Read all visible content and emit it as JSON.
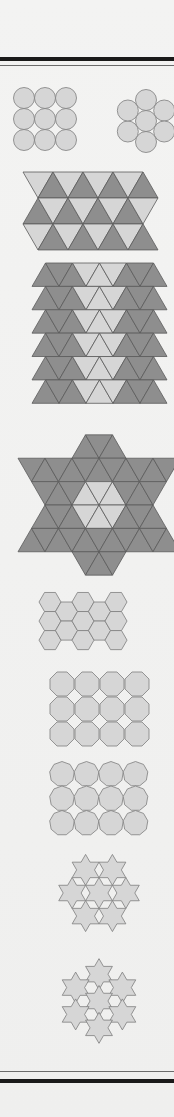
{
  "page": {
    "background": "#f1f1f0",
    "rules": [
      {
        "kind": "thick",
        "y": 57,
        "h": 4
      },
      {
        "kind": "thin",
        "y": 65,
        "h": 1
      },
      {
        "kind": "thin",
        "y": 1071,
        "h": 1
      },
      {
        "kind": "thick",
        "y": 1079,
        "h": 4
      }
    ]
  },
  "colors": {
    "light_fill": "#d6d6d6",
    "dark_fill": "#8e8e8e",
    "stroke": "#7d7d7d",
    "dark_stroke": "#5a5a5a"
  },
  "figures": [
    {
      "id": "square-circle-packing",
      "type": "circle-square-grid",
      "cols": 3,
      "rows": 3,
      "cx0": 24,
      "cy0": 98,
      "r": 10.5
    },
    {
      "id": "hex-circle-packing",
      "type": "circle-hex-cluster",
      "cx": 146,
      "cy": 121,
      "r": 10.5
    },
    {
      "id": "triangle-band",
      "type": "triangle-band",
      "x0": 38,
      "y0": 172,
      "side": 30,
      "rows": 3,
      "cols": 4
    },
    {
      "id": "triangle-field",
      "type": "triangle-field",
      "x0": 32,
      "y0": 263,
      "side": 27,
      "rows": 6
    },
    {
      "id": "hexagram-triangles",
      "type": "hexagram-triangles",
      "cx": 99,
      "cy": 505,
      "side": 27
    },
    {
      "id": "hexagon-tiling",
      "type": "hexagon-grid",
      "x0": 64,
      "y0": 602,
      "r": 11,
      "cols": 5,
      "rows": 3
    },
    {
      "id": "octagon-tiling",
      "type": "polygon-grid",
      "sides": 8,
      "x0": 62,
      "y0": 684,
      "step": 25,
      "r": 13,
      "cols": 4,
      "rows": 3
    },
    {
      "id": "nonagon-tiling",
      "type": "polygon-grid",
      "sides": 9,
      "x0": 62,
      "y0": 774,
      "step": 24.5,
      "r": 12.5,
      "cols": 4,
      "rows": 3
    },
    {
      "id": "hexagram-tiling-1",
      "type": "star-cluster",
      "cx": 99,
      "cy": 893,
      "r": 15.5,
      "variant": 1
    },
    {
      "id": "hexagram-tiling-2",
      "type": "star-cluster",
      "cx": 99,
      "cy": 1001,
      "r": 15.5,
      "variant": 2
    }
  ]
}
